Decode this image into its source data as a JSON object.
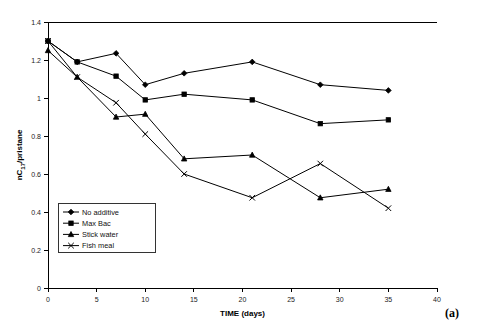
{
  "panel_label": "(a)",
  "chart_data": {
    "type": "line",
    "title": "",
    "xlabel": "TIME (days)",
    "ylabel": "nC17/pristane",
    "ylabel_parts": {
      "pre": "nC",
      "sub": "17",
      "post": "/pristane"
    },
    "x": [
      0,
      3,
      7,
      10,
      14,
      21,
      28,
      35
    ],
    "xlim": [
      0,
      40
    ],
    "ylim": [
      0,
      1.4
    ],
    "xticks": [
      0,
      5,
      10,
      15,
      20,
      25,
      30,
      35,
      40
    ],
    "xticklabels": [
      "0",
      "5",
      "10",
      "15",
      "20",
      "25",
      "30",
      "35",
      "40"
    ],
    "yticks": [
      0,
      0.2,
      0.4,
      0.6,
      0.8,
      1.0,
      1.2,
      1.4
    ],
    "yticklabels": [
      "0",
      "0.2",
      "0.4",
      "0.6",
      "0.8",
      "1",
      "1.2",
      "1.4"
    ],
    "grid": false,
    "legend_position": "lower-left-inside",
    "series": [
      {
        "name": "No additive",
        "marker": "diamond",
        "color": "#000000",
        "x": [
          0,
          3,
          7,
          10,
          14,
          21,
          28,
          35
        ],
        "values": [
          1.3,
          1.19,
          1.235,
          1.07,
          1.13,
          1.19,
          1.07,
          1.04
        ]
      },
      {
        "name": "Max Bac",
        "marker": "square",
        "color": "#000000",
        "x": [
          0,
          3,
          7,
          10,
          14,
          21,
          28,
          35
        ],
        "values": [
          1.3,
          1.19,
          1.115,
          0.99,
          1.02,
          0.99,
          0.865,
          0.885
        ]
      },
      {
        "name": "Stick water",
        "marker": "triangle",
        "color": "#000000",
        "x": [
          0,
          3,
          7,
          10,
          14,
          21,
          28,
          35
        ],
        "values": [
          1.25,
          1.11,
          0.9,
          0.915,
          0.68,
          0.7,
          0.475,
          0.52
        ]
      },
      {
        "name": "Fish meal",
        "marker": "cross",
        "color": "#000000",
        "x": [
          0,
          3,
          7,
          10,
          14,
          21,
          28,
          35
        ],
        "values": [
          1.3,
          1.11,
          0.975,
          0.81,
          0.6,
          0.475,
          0.655,
          0.42
        ]
      }
    ]
  }
}
